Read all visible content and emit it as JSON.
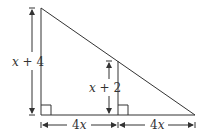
{
  "diagram": {
    "type": "geometry-similar-triangles",
    "colors": {
      "line": "#333333",
      "background": "#ffffff"
    },
    "labels": {
      "outer_height_var": "x",
      "outer_height_rest": " + 4",
      "inner_height_var": "x",
      "inner_height_rest": " + 2",
      "left_base_num": "4",
      "left_base_var": "x",
      "right_base_num": "4",
      "right_base_var": "x"
    },
    "markers": [
      "right-angle-left",
      "right-angle-inner"
    ]
  }
}
